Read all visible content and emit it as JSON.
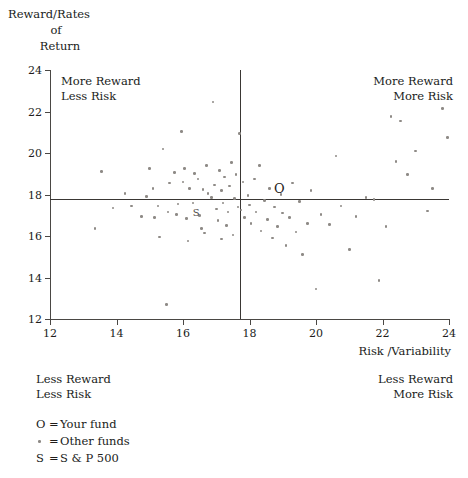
{
  "chart_data": {
    "type": "scatter",
    "title": "",
    "ylabel": "Reward/Rates of Return",
    "ylabel_lines": [
      "Reward/Rates",
      "of",
      "Return"
    ],
    "xlabel": "Risk /Variability",
    "xlim": [
      12,
      24
    ],
    "ylim": [
      12,
      24
    ],
    "xticks": [
      12,
      14,
      16,
      18,
      20,
      22,
      24
    ],
    "yticks": [
      12,
      14,
      16,
      18,
      20,
      22,
      24
    ],
    "grid": false,
    "legend_position": "below-left",
    "crosshair": {
      "x": 17.7,
      "y": 17.8
    },
    "annotations": [
      {
        "text": "More Reward\nLess Risk",
        "quadrant": "top-left"
      },
      {
        "text": "More Reward\nMore Risk",
        "quadrant": "top-right"
      },
      {
        "text": "Less Reward\nLess Risk",
        "quadrant": "bottom-left"
      },
      {
        "text": "Less Reward\nMore Risk",
        "quadrant": "bottom-right"
      }
    ],
    "series": [
      {
        "name": "Other funds",
        "marker": "dot",
        "points": [
          [
            13.55,
            19.1
          ],
          [
            13.9,
            17.35
          ],
          [
            14.25,
            18.05
          ],
          [
            14.75,
            16.95
          ],
          [
            15.0,
            19.25
          ],
          [
            15.1,
            18.3
          ],
          [
            15.15,
            16.9
          ],
          [
            15.25,
            17.45
          ],
          [
            15.4,
            20.2
          ],
          [
            15.5,
            12.7
          ],
          [
            15.6,
            18.55
          ],
          [
            15.75,
            19.05
          ],
          [
            15.8,
            17.05
          ],
          [
            15.85,
            17.55
          ],
          [
            15.95,
            21.05
          ],
          [
            16.0,
            18.6
          ],
          [
            16.05,
            19.25
          ],
          [
            16.1,
            16.85
          ],
          [
            16.2,
            18.3
          ],
          [
            16.3,
            17.6
          ],
          [
            16.35,
            19.0
          ],
          [
            16.45,
            18.75
          ],
          [
            16.5,
            17.0
          ],
          [
            16.55,
            16.35
          ],
          [
            16.6,
            18.25
          ],
          [
            16.7,
            19.4
          ],
          [
            16.75,
            18.05
          ],
          [
            16.85,
            17.85
          ],
          [
            16.9,
            22.45
          ],
          [
            16.95,
            18.45
          ],
          [
            17.0,
            17.3
          ],
          [
            17.05,
            16.75
          ],
          [
            17.1,
            19.15
          ],
          [
            17.15,
            18.2
          ],
          [
            17.2,
            17.6
          ],
          [
            17.25,
            18.85
          ],
          [
            17.3,
            16.5
          ],
          [
            17.35,
            17.15
          ],
          [
            17.4,
            18.4
          ],
          [
            17.45,
            19.55
          ],
          [
            17.5,
            16.05
          ],
          [
            17.55,
            17.8
          ],
          [
            17.6,
            18.95
          ],
          [
            17.65,
            17.4
          ],
          [
            17.7,
            20.95
          ],
          [
            17.75,
            17.25
          ],
          [
            17.8,
            18.6
          ],
          [
            17.85,
            16.9
          ],
          [
            17.95,
            17.95
          ],
          [
            18.0,
            17.5
          ],
          [
            18.05,
            16.6
          ],
          [
            18.15,
            18.75
          ],
          [
            18.2,
            17.15
          ],
          [
            18.3,
            19.4
          ],
          [
            18.35,
            16.25
          ],
          [
            18.45,
            17.7
          ],
          [
            18.55,
            16.8
          ],
          [
            18.6,
            18.3
          ],
          [
            18.7,
            15.9
          ],
          [
            18.75,
            17.4
          ],
          [
            18.85,
            16.45
          ],
          [
            18.95,
            18.0
          ],
          [
            19.0,
            17.1
          ],
          [
            19.1,
            15.55
          ],
          [
            19.2,
            16.9
          ],
          [
            19.3,
            18.55
          ],
          [
            19.4,
            16.2
          ],
          [
            19.5,
            17.65
          ],
          [
            19.6,
            15.1
          ],
          [
            19.75,
            16.6
          ],
          [
            19.85,
            18.2
          ],
          [
            20.0,
            13.45
          ],
          [
            20.15,
            17.05
          ],
          [
            20.4,
            16.55
          ],
          [
            20.6,
            19.85
          ],
          [
            20.75,
            17.45
          ],
          [
            21.0,
            15.35
          ],
          [
            21.2,
            16.95
          ],
          [
            21.5,
            17.85
          ],
          [
            21.75,
            17.75
          ],
          [
            21.9,
            13.85
          ],
          [
            22.1,
            16.45
          ],
          [
            22.25,
            21.75
          ],
          [
            22.4,
            19.6
          ],
          [
            22.55,
            21.55
          ],
          [
            22.75,
            18.95
          ],
          [
            23.0,
            20.1
          ],
          [
            23.35,
            17.2
          ],
          [
            23.8,
            22.15
          ],
          [
            23.95,
            20.75
          ],
          [
            23.5,
            18.3
          ],
          [
            13.35,
            16.35
          ],
          [
            14.45,
            17.45
          ],
          [
            15.3,
            15.95
          ],
          [
            16.15,
            15.75
          ],
          [
            16.65,
            16.15
          ],
          [
            17.15,
            15.85
          ],
          [
            14.9,
            17.9
          ],
          [
            15.55,
            17.15
          ]
        ]
      },
      {
        "name": "Your fund",
        "marker": "O",
        "label": "O",
        "points": [
          [
            18.9,
            18.3
          ]
        ]
      },
      {
        "name": "S & P 500",
        "marker": "S",
        "label": "S",
        "points": [
          [
            16.4,
            17.1
          ]
        ]
      }
    ]
  },
  "axis": {
    "y_title_lines": [
      "Reward/Rates",
      "of",
      "Return"
    ],
    "x_title": "Risk /Variability",
    "x_tick_labels": [
      "12",
      "14",
      "16",
      "18",
      "20",
      "22",
      "24"
    ],
    "y_tick_labels": [
      "24",
      "22",
      "20",
      "18",
      "16",
      "14",
      "12"
    ]
  },
  "quadrants": {
    "top_left": {
      "line1": "More Reward",
      "line2": "Less Risk"
    },
    "top_right": {
      "line1": "More Reward",
      "line2": "More Risk"
    },
    "bottom_left": {
      "line1": "Less Reward",
      "line2": "Less Risk"
    },
    "bottom_right": {
      "line1": "Less Reward",
      "line2": "More Risk"
    }
  },
  "legend": {
    "rows": [
      {
        "symbol": "O",
        "equals": "=",
        "text": "Your fund"
      },
      {
        "symbol": "",
        "equals": "=",
        "text": "Other funds"
      },
      {
        "symbol": "S",
        "equals": "=",
        "text": "S & P 500"
      }
    ]
  },
  "colors": {
    "axis": "#4a4744",
    "crosshair": "#3a3734",
    "point": "#8e8a86",
    "text": "#201c1a",
    "background": "#ffffff"
  }
}
